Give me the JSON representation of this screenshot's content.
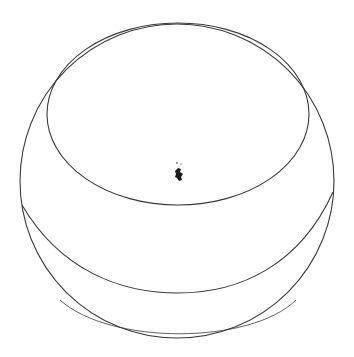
{
  "figure": {
    "stroke_color": "#3a3a3a",
    "background_color": "#ffffff",
    "parts": [
      {
        "name": "outer-circle",
        "label": "sphere outline"
      },
      {
        "name": "cap-ellipse",
        "label": "upper cap"
      },
      {
        "name": "band-arc",
        "label": "lower band"
      },
      {
        "name": "center-mark",
        "label": "small ink mark"
      }
    ]
  }
}
